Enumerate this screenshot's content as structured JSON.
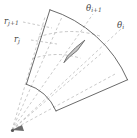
{
  "figure": {
    "type": "diagram",
    "background_color": "#ffffff",
    "stroke_color": "#5a5a5a",
    "dash_color": "#9a9a9a",
    "cell_fill_color": "#c9c9c9",
    "cell_stroke_color": "#555555"
  },
  "labels": {
    "r_j_plus_1": {
      "base": "r",
      "sub": "j+1"
    },
    "r_j": {
      "base": "r",
      "sub": "j"
    },
    "theta_i_plus_1": {
      "base": "θ",
      "sub": "i+1"
    },
    "theta_i": {
      "base": "θ",
      "sub": "i"
    }
  },
  "geometry": {
    "origin": {
      "x": 12,
      "y": 130
    },
    "angle_start_deg": -72.5,
    "angle_end_deg": -23.5,
    "radius_inner_solid": 48,
    "radius_outer_solid": 126,
    "radius_r_j": 74,
    "radius_r_j_plus_1": 96,
    "theta_i_deg": -45.5,
    "theta_i_plus_1_deg": -58.5,
    "extra_dashed_rays_deg": [
      -66,
      -52,
      -38,
      -30
    ]
  }
}
